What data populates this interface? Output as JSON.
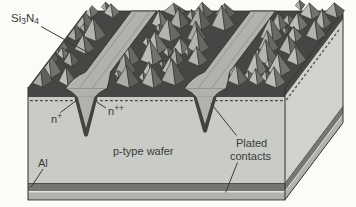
{
  "figure": {
    "kind": "solar-cell-cross-section-diagram",
    "labels": {
      "si3n4": {
        "p0": "Si",
        "s0": "3",
        "p1": "N",
        "s1": "4"
      },
      "n_plus": {
        "base": "n",
        "sup": "+"
      },
      "n_plus_plus": {
        "base": "n",
        "sup": "++"
      },
      "p_type_wafer": "p-type wafer",
      "al": "Al",
      "plated_contacts_line1": "Plated",
      "plated_contacts_line2": "contacts"
    },
    "colors": {
      "background": "#fbfbf8",
      "texture_dark": "#454744",
      "pyramid_light": "#b2b4b0",
      "pyramid_dark": "#666964",
      "wafer_front": "#c9cbc7",
      "wafer_side": "#d0d2ce",
      "aluminum": "#737672",
      "plated_metal": "#b0b2ae",
      "groove_gutter": "#93958f",
      "outline": "#2f302e",
      "junction_dash": "#4b4b48",
      "highlight_line": "#e2e2de",
      "label_ink": "#3a3b39"
    }
  }
}
